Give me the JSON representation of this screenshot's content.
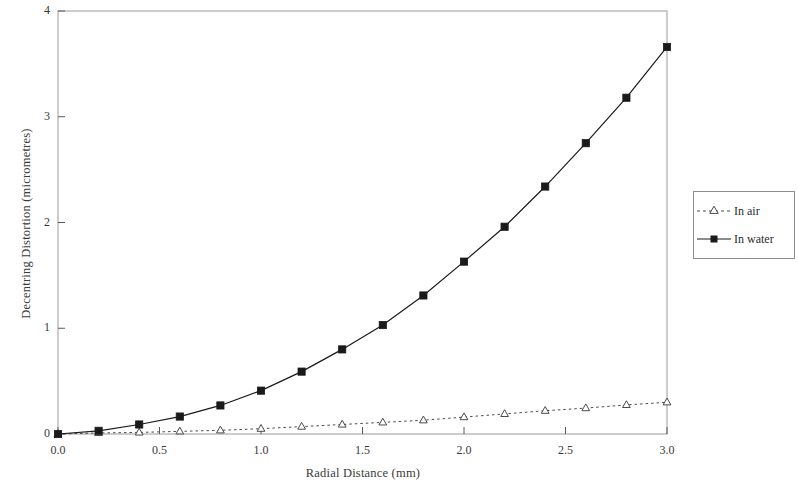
{
  "chart_data": {
    "type": "line",
    "title": "",
    "xlabel": "Radial Distance (mm)",
    "ylabel": "Decentring Distortion (micrometres)",
    "xlim": [
      0.0,
      3.0
    ],
    "ylim": [
      0,
      4
    ],
    "xticks": [
      "0.0",
      "0.5",
      "1.0",
      "1.5",
      "2.0",
      "2.5",
      "3.0"
    ],
    "xtick_values": [
      0.0,
      0.5,
      1.0,
      1.5,
      2.0,
      2.5,
      3.0
    ],
    "yticks": [
      "0",
      "1",
      "2",
      "3",
      "4"
    ],
    "ytick_values": [
      0,
      1,
      2,
      3,
      4
    ],
    "grid": false,
    "legend_position": "right-outside",
    "x": [
      0.0,
      0.2,
      0.4,
      0.6,
      0.8,
      1.0,
      1.2,
      1.4,
      1.6,
      1.8,
      2.0,
      2.2,
      2.4,
      2.6,
      2.8,
      3.0
    ],
    "series": [
      {
        "name": "In air",
        "marker": "open-triangle",
        "linestyle": "dotted",
        "color": "#4a4a4a",
        "values": [
          0.0,
          0.01,
          0.015,
          0.025,
          0.035,
          0.05,
          0.07,
          0.09,
          0.11,
          0.13,
          0.16,
          0.19,
          0.22,
          0.245,
          0.275,
          0.3
        ]
      },
      {
        "name": "In water",
        "marker": "filled-square",
        "linestyle": "solid",
        "color": "#1a1a1a",
        "values": [
          0.0,
          0.03,
          0.09,
          0.165,
          0.27,
          0.41,
          0.59,
          0.8,
          1.03,
          1.31,
          1.63,
          1.96,
          2.34,
          2.75,
          3.18,
          3.66
        ]
      }
    ]
  },
  "legend": {
    "items": [
      {
        "label": "In air"
      },
      {
        "label": "In water"
      }
    ]
  },
  "axis_titles": {
    "x": "Radial Distance (mm)",
    "y": "Decentring Distortion (micrometres)"
  }
}
